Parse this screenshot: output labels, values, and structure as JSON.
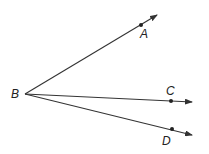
{
  "diagram": {
    "vertex": {
      "label": "B",
      "x": 25,
      "y": 94
    },
    "rays": [
      {
        "point_label": "A",
        "point": [
          141,
          25
        ],
        "tip": [
          157,
          15
        ],
        "label_pos": [
          140,
          38
        ]
      },
      {
        "point_label": "C",
        "point": [
          171,
          101
        ],
        "tip": [
          192,
          102
        ],
        "label_pos": [
          166,
          95
        ]
      },
      {
        "point_label": "D",
        "point": [
          172,
          129
        ],
        "tip": [
          192,
          135
        ],
        "label_pos": [
          162,
          145
        ]
      }
    ],
    "vertex_label_pos": [
      11,
      98
    ],
    "stroke_color": "#333333"
  }
}
